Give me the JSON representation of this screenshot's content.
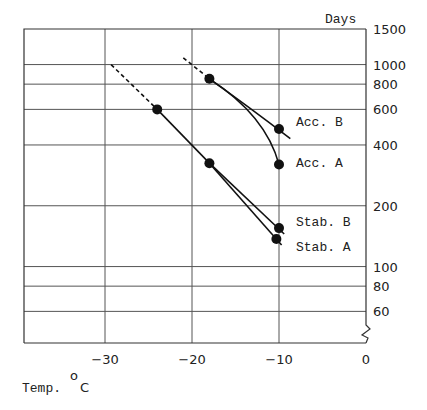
{
  "chart_data": {
    "type": "line",
    "title": "",
    "xlabel": "Temp. °C",
    "xlabel_main": "Temp.",
    "xlabel_unit": "C",
    "ylabel": "Days",
    "xlim": [
      -39.5,
      0
    ],
    "ylim_log": [
      48,
      1500
    ],
    "y_scale": "log",
    "y_axis_break": true,
    "grid": true,
    "x_ticks": [
      -30,
      -20,
      -10,
      0
    ],
    "x_tick_labels": [
      "-30",
      "-20",
      "-10",
      "0"
    ],
    "y_ticks": [
      1500,
      1000,
      800,
      600,
      400,
      200,
      100,
      80,
      60
    ],
    "y_tick_labels": [
      "1500",
      "1000",
      "800",
      "600",
      "400",
      "200",
      "100",
      "80",
      "60"
    ],
    "series": [
      {
        "name": "Acc. B",
        "points": [
          {
            "x": -18,
            "y": 850
          },
          {
            "x": -10,
            "y": 480
          }
        ],
        "extrapolated_from": {
          "x": -21,
          "y": 1080
        },
        "extends_to": {
          "x": -8.7,
          "y": 430
        }
      },
      {
        "name": "Acc. A",
        "points": [
          {
            "x": -18,
            "y": 850
          },
          {
            "x": -10,
            "y": 320
          }
        ],
        "extrapolated_from": {
          "x": -21,
          "y": 1080
        },
        "curved": true
      },
      {
        "name": "Stab. B",
        "points": [
          {
            "x": -24,
            "y": 600
          },
          {
            "x": -18,
            "y": 325
          },
          {
            "x": -10,
            "y": 155
          }
        ],
        "extrapolated_from": {
          "x": -29.3,
          "y": 1000
        },
        "extends_to": {
          "x": -9.4,
          "y": 145
        }
      },
      {
        "name": "Stab. A",
        "points": [
          {
            "x": -24,
            "y": 600
          },
          {
            "x": -18,
            "y": 325
          },
          {
            "x": -10.3,
            "y": 137
          }
        ],
        "extrapolated_from": {
          "x": -29.3,
          "y": 1000
        },
        "extends_to": {
          "x": -9.7,
          "y": 128
        }
      }
    ],
    "annotations": [
      "Acc. B",
      "Acc. A",
      "Stab. B",
      "Stab. A"
    ]
  }
}
